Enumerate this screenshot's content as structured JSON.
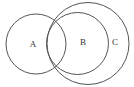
{
  "diagram": {
    "type": "venn",
    "sets": [
      {
        "id": "A",
        "label": "A",
        "cx": 36,
        "cy": 44,
        "r": 30,
        "label_x": 33,
        "label_y": 45
      },
      {
        "id": "B",
        "label": "B",
        "cx": 77.5,
        "cy": 43.5,
        "r": 31,
        "label_x": 83,
        "label_y": 43
      },
      {
        "id": "C",
        "label": "C",
        "cx": 88,
        "cy": 43.5,
        "r": 41,
        "label_x": 115,
        "label_y": 43
      }
    ],
    "stroke_color": "#555555",
    "background": "#ffffff"
  }
}
